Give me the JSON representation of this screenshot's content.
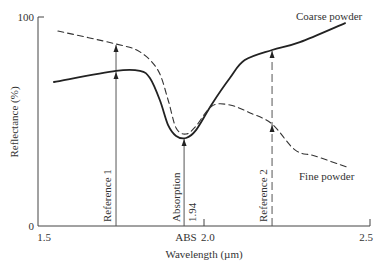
{
  "chart_data": {
    "type": "line",
    "title": "",
    "xlabel": "Wavelength (µm)",
    "ylabel": "Reflectance (%)",
    "xlim": [
      1.5,
      2.5
    ],
    "ylim": [
      0,
      100
    ],
    "grid": false,
    "x_ticks": [
      {
        "value": 1.5,
        "label": "1.5"
      },
      {
        "value": 2.0,
        "label": "2.0"
      },
      {
        "value": 2.5,
        "label": "2.5"
      }
    ],
    "y_ticks": [
      {
        "value": 0,
        "label": "0"
      },
      {
        "value": 100,
        "label": "100"
      }
    ],
    "series": [
      {
        "name": "Coarse powder",
        "style": "solid",
        "color": "#222222",
        "x": [
          1.548,
          1.735,
          1.807,
          1.837,
          1.867,
          1.892,
          1.916,
          1.946,
          1.976,
          2.024,
          2.078,
          2.123,
          2.205,
          2.289,
          2.425
        ],
        "y": [
          68.9,
          74.2,
          74.2,
          70.8,
          60.3,
          48.3,
          43.1,
          42.1,
          45.9,
          58.4,
          70.8,
          79.4,
          84.2,
          88.0,
          97.1
        ]
      },
      {
        "name": "Fine powder",
        "style": "dashed",
        "color": "#333333",
        "x": [
          1.56,
          1.735,
          1.807,
          1.861,
          1.892,
          1.916,
          1.946,
          1.976,
          2.024,
          2.078,
          2.139,
          2.205,
          2.274,
          2.334,
          2.431
        ],
        "y": [
          93.3,
          87.1,
          83.3,
          74.6,
          60.3,
          46.9,
          44.0,
          47.8,
          57.4,
          57.9,
          54.1,
          48.8,
          36.4,
          33.5,
          28.2
        ]
      }
    ],
    "annotations": [
      {
        "type": "arrow-line",
        "label": "Reference 1",
        "x": 1.735,
        "style": "solid",
        "arrow_to": [
          74.2,
          87.1
        ]
      },
      {
        "type": "arrow-line",
        "label": "Absorption",
        "x": 1.94,
        "style": "solid",
        "arrow_to": [
          42.1
        ]
      },
      {
        "type": "arrow-line",
        "label": "Reference 2",
        "x": 2.205,
        "style": "dashed",
        "arrow_to": [
          48.8,
          84.2
        ]
      },
      {
        "type": "tick-label",
        "label": "1.94",
        "x": 1.94
      },
      {
        "type": "axis-label",
        "label": "ABS",
        "x": 1.94
      },
      {
        "type": "series-label",
        "label": "Coarse powder",
        "series": "Coarse powder",
        "near": "top-right"
      },
      {
        "type": "series-label",
        "label": "Fine powder",
        "series": "Fine powder",
        "near": "right"
      }
    ],
    "legend": "none (inline series labels)"
  }
}
